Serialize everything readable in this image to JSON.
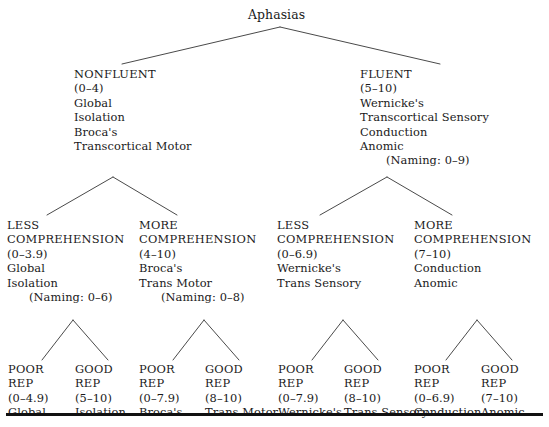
{
  "figure": {
    "root": {
      "label": "Aphasias"
    },
    "level2": [
      {
        "id": "nonfluent",
        "heading": "NONFLUENT",
        "range": "(0–4)",
        "items": [
          "Global",
          "Isolation",
          "Broca's",
          "Transcortical Motor"
        ],
        "naming": ""
      },
      {
        "id": "fluent",
        "heading": "FLUENT",
        "range": "(5–10)",
        "items": [
          "Wernicke's",
          "Transcortical Sensory",
          "Conduction",
          "Anomic"
        ],
        "naming": "(Naming: 0–9)"
      }
    ],
    "level3": [
      {
        "id": "nonfluent-less-comprehension",
        "heading_line1": "LESS",
        "heading_line2": "COMPREHENSION",
        "range": "(0–3.9)",
        "items": [
          "Global",
          "Isolation"
        ],
        "naming": "(Naming: 0–6)"
      },
      {
        "id": "nonfluent-more-comprehension",
        "heading_line1": "MORE",
        "heading_line2": "COMPREHENSION",
        "range": "(4–10)",
        "items": [
          "Broca's",
          "Trans Motor"
        ],
        "naming": "(Naming: 0–8)"
      },
      {
        "id": "fluent-less-comprehension",
        "heading_line1": "LESS",
        "heading_line2": "COMPREHENSION",
        "range": "(0–6.9)",
        "items": [
          "Wernicke's",
          "Trans Sensory"
        ],
        "naming": ""
      },
      {
        "id": "fluent-more-comprehension",
        "heading_line1": "MORE",
        "heading_line2": "COMPREHENSION",
        "range": "(7–10)",
        "items": [
          "Conduction",
          "Anomic"
        ],
        "naming": ""
      }
    ],
    "leaves": [
      {
        "id": "leaf-global",
        "heading_line1": "POOR",
        "heading_line2": "REP",
        "range": "(0–4.9)",
        "diagnosis": "Global"
      },
      {
        "id": "leaf-isolation",
        "heading_line1": "GOOD",
        "heading_line2": "REP",
        "range": "(5–10)",
        "diagnosis": "Isolation"
      },
      {
        "id": "leaf-brocas",
        "heading_line1": "POOR",
        "heading_line2": "REP",
        "range": "(0–7.9)",
        "diagnosis": "Broca's"
      },
      {
        "id": "leaf-trans-motor",
        "heading_line1": "GOOD",
        "heading_line2": "REP",
        "range": "(8–10)",
        "diagnosis": "Trans Motor"
      },
      {
        "id": "leaf-wernickes",
        "heading_line1": "POOR",
        "heading_line2": "REP",
        "range": "(0–7.9)",
        "diagnosis": "Wernicke's"
      },
      {
        "id": "leaf-trans-sensory",
        "heading_line1": "GOOD",
        "heading_line2": "REP",
        "range": "(8–10)",
        "diagnosis": "Trans Sensory"
      },
      {
        "id": "leaf-conduction",
        "heading_line1": "POOR",
        "heading_line2": "REP",
        "range": "(0–6.9)",
        "diagnosis": "Conduction"
      },
      {
        "id": "leaf-anomic",
        "heading_line1": "GOOD",
        "heading_line2": "REP",
        "range": "(7–10)",
        "diagnosis": "Anomic"
      }
    ],
    "colors": {
      "text": "#1a1a1a",
      "line": "#4a4a4a",
      "rule": "#111111",
      "background": "#ffffff"
    }
  }
}
